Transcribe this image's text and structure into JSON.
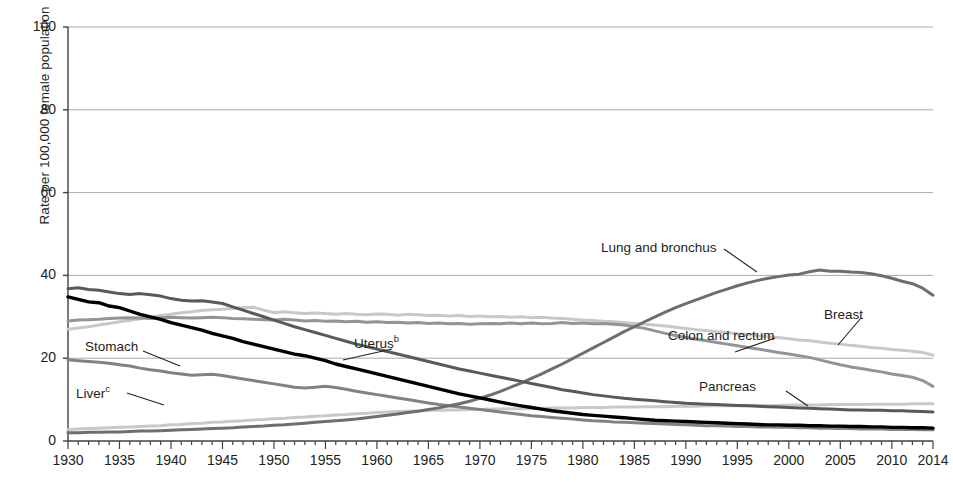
{
  "axes": {
    "ylabel": "Rate per 100,000 female population",
    "yticks": [
      "0",
      "20",
      "40",
      "60",
      "80",
      "100"
    ],
    "xticks": [
      "1930",
      "1935",
      "1940",
      "1945",
      "1950",
      "1955",
      "1960",
      "1965",
      "1970",
      "1975",
      "1980",
      "1985",
      "1990",
      "1995",
      "2000",
      "2005",
      "2010",
      "2014"
    ]
  },
  "labels": {
    "lung": "Lung and bronchus",
    "breast": "Breast",
    "colon": "Colon and rectum",
    "uterus": "Uterus",
    "uterus_sup": "b",
    "stomach": "Stomach",
    "liver": "Liver",
    "liver_sup": "c",
    "pancreas": "Pancreas"
  },
  "chart_data": {
    "type": "line",
    "title": "",
    "xlabel": "",
    "ylabel": "Rate per 100,000 female population",
    "xlim": [
      1930,
      2014
    ],
    "ylim": [
      0,
      100
    ],
    "grid": true,
    "legend": "inline-annotations",
    "x": [
      1930,
      1931,
      1932,
      1933,
      1934,
      1935,
      1936,
      1937,
      1938,
      1939,
      1940,
      1941,
      1942,
      1943,
      1944,
      1945,
      1946,
      1947,
      1948,
      1949,
      1950,
      1951,
      1952,
      1953,
      1954,
      1955,
      1956,
      1957,
      1958,
      1959,
      1960,
      1961,
      1962,
      1963,
      1964,
      1965,
      1966,
      1967,
      1968,
      1969,
      1970,
      1971,
      1972,
      1973,
      1974,
      1975,
      1976,
      1977,
      1978,
      1979,
      1980,
      1981,
      1982,
      1983,
      1984,
      1985,
      1986,
      1987,
      1988,
      1989,
      1990,
      1991,
      1992,
      1993,
      1994,
      1995,
      1996,
      1997,
      1998,
      1999,
      2000,
      2001,
      2002,
      2003,
      2004,
      2005,
      2006,
      2007,
      2008,
      2009,
      2010,
      2011,
      2012,
      2013,
      2014
    ],
    "series": [
      {
        "name": "Lung and bronchus",
        "color": "#6d6e71",
        "width": 3.0,
        "values": [
          2.0,
          2.0,
          2.1,
          2.1,
          2.2,
          2.2,
          2.3,
          2.4,
          2.4,
          2.5,
          2.6,
          2.7,
          2.8,
          2.9,
          3.0,
          3.1,
          3.2,
          3.4,
          3.5,
          3.6,
          3.8,
          3.9,
          4.1,
          4.3,
          4.5,
          4.7,
          4.9,
          5.1,
          5.3,
          5.6,
          5.9,
          6.2,
          6.5,
          6.9,
          7.2,
          7.6,
          8.0,
          8.5,
          9.0,
          9.6,
          10.3,
          11.1,
          12.0,
          13.0,
          14.0,
          15.1,
          16.2,
          17.4,
          18.6,
          19.9,
          21.2,
          22.5,
          23.8,
          25.1,
          26.4,
          27.6,
          28.8,
          30.0,
          31.1,
          32.2,
          33.2,
          34.1,
          35.0,
          35.9,
          36.7,
          37.5,
          38.2,
          38.8,
          39.3,
          39.7,
          40.1,
          40.3,
          40.9,
          41.3,
          41.0,
          41.0,
          40.8,
          40.7,
          40.4,
          39.9,
          39.3,
          38.6,
          38.0,
          36.9,
          35.2
        ]
      },
      {
        "name": "Breast",
        "color": "#c7c8ca",
        "width": 3.0,
        "values": [
          27.0,
          27.3,
          27.6,
          28.0,
          28.4,
          28.8,
          29.1,
          29.5,
          29.9,
          30.3,
          30.6,
          31.0,
          31.2,
          31.5,
          31.7,
          31.8,
          32.0,
          32.2,
          32.3,
          31.6,
          31.0,
          31.2,
          31.0,
          30.8,
          30.9,
          30.8,
          30.6,
          30.8,
          30.6,
          30.5,
          30.7,
          30.6,
          30.4,
          30.6,
          30.5,
          30.3,
          30.4,
          30.2,
          30.3,
          30.1,
          30.2,
          30.0,
          30.1,
          29.9,
          30.0,
          29.8,
          29.9,
          29.7,
          29.6,
          29.4,
          29.2,
          29.1,
          28.9,
          28.8,
          28.6,
          28.4,
          28.2,
          28.0,
          27.8,
          27.5,
          27.2,
          26.9,
          26.7,
          26.4,
          26.2,
          25.9,
          25.7,
          25.4,
          25.2,
          25.0,
          24.7,
          24.4,
          24.2,
          23.9,
          23.6,
          23.4,
          23.1,
          22.9,
          22.6,
          22.4,
          22.1,
          21.9,
          21.7,
          21.4,
          20.7
        ]
      },
      {
        "name": "Colon and rectum",
        "color": "#929497",
        "width": 3.0,
        "values": [
          29.0,
          29.2,
          29.3,
          29.4,
          29.6,
          29.7,
          29.8,
          29.7,
          29.6,
          29.8,
          29.9,
          29.8,
          29.7,
          29.8,
          29.9,
          29.8,
          29.6,
          29.5,
          29.4,
          29.3,
          29.2,
          29.4,
          29.2,
          29.0,
          29.1,
          28.9,
          29.0,
          28.8,
          28.9,
          28.7,
          28.8,
          28.6,
          28.7,
          28.5,
          28.6,
          28.4,
          28.5,
          28.3,
          28.4,
          28.2,
          28.3,
          28.4,
          28.3,
          28.5,
          28.3,
          28.5,
          28.3,
          28.4,
          28.6,
          28.4,
          28.5,
          28.3,
          28.4,
          28.2,
          28.0,
          27.6,
          27.2,
          26.6,
          26.0,
          25.5,
          25.0,
          24.6,
          24.2,
          23.8,
          23.4,
          23.0,
          22.6,
          22.2,
          21.8,
          21.4,
          21.0,
          20.6,
          20.2,
          19.6,
          19.0,
          18.4,
          17.9,
          17.5,
          17.1,
          16.7,
          16.2,
          15.8,
          15.4,
          14.6,
          13.2
        ]
      },
      {
        "name": "Uterus",
        "color": "#58595b",
        "width": 3.0,
        "values": [
          36.8,
          37.0,
          36.6,
          36.4,
          36.0,
          35.6,
          35.4,
          35.6,
          35.3,
          35.0,
          34.4,
          34.0,
          33.8,
          33.9,
          33.6,
          33.2,
          32.4,
          31.6,
          30.8,
          30.0,
          29.2,
          28.4,
          27.6,
          26.9,
          26.2,
          25.5,
          24.8,
          24.1,
          23.4,
          22.8,
          22.2,
          21.6,
          21.0,
          20.4,
          19.8,
          19.2,
          18.6,
          18.0,
          17.4,
          16.9,
          16.4,
          15.9,
          15.4,
          14.9,
          14.4,
          13.9,
          13.4,
          12.9,
          12.4,
          12.0,
          11.6,
          11.2,
          10.9,
          10.6,
          10.3,
          10.1,
          9.9,
          9.7,
          9.5,
          9.3,
          9.1,
          9.0,
          8.9,
          8.8,
          8.7,
          8.6,
          8.5,
          8.4,
          8.3,
          8.2,
          8.1,
          8.0,
          7.9,
          7.8,
          7.7,
          7.6,
          7.5,
          7.5,
          7.4,
          7.4,
          7.3,
          7.3,
          7.2,
          7.1,
          7.0
        ]
      },
      {
        "name": "Stomach",
        "color": "#000000",
        "width": 3.4,
        "values": [
          34.8,
          34.2,
          33.6,
          33.4,
          32.6,
          32.2,
          31.4,
          30.6,
          30.0,
          29.4,
          28.6,
          28.0,
          27.4,
          26.8,
          26.0,
          25.4,
          24.8,
          24.0,
          23.4,
          22.8,
          22.2,
          21.6,
          21.0,
          20.6,
          20.0,
          19.4,
          18.6,
          18.0,
          17.4,
          16.8,
          16.2,
          15.6,
          15.0,
          14.4,
          13.8,
          13.2,
          12.6,
          12.0,
          11.4,
          10.9,
          10.4,
          9.9,
          9.4,
          8.9,
          8.5,
          8.1,
          7.7,
          7.3,
          7.0,
          6.7,
          6.4,
          6.2,
          6.0,
          5.8,
          5.6,
          5.4,
          5.2,
          5.0,
          4.9,
          4.8,
          4.7,
          4.6,
          4.5,
          4.4,
          4.3,
          4.2,
          4.1,
          4.0,
          3.9,
          3.9,
          3.8,
          3.8,
          3.7,
          3.7,
          3.6,
          3.6,
          3.5,
          3.5,
          3.4,
          3.4,
          3.3,
          3.3,
          3.2,
          3.2,
          3.1
        ]
      },
      {
        "name": "Liver",
        "color": "#808285",
        "width": 3.0,
        "values": [
          19.6,
          19.4,
          19.2,
          19.0,
          18.8,
          18.4,
          18.1,
          17.6,
          17.2,
          16.9,
          16.5,
          16.2,
          15.9,
          16.0,
          16.1,
          15.8,
          15.4,
          15.0,
          14.6,
          14.2,
          13.8,
          13.4,
          13.0,
          12.8,
          13.0,
          13.2,
          12.9,
          12.5,
          12.0,
          11.6,
          11.2,
          10.8,
          10.4,
          10.0,
          9.6,
          9.2,
          8.8,
          8.5,
          8.2,
          7.9,
          7.6,
          7.3,
          7.0,
          6.7,
          6.4,
          6.1,
          5.9,
          5.7,
          5.5,
          5.3,
          5.1,
          4.9,
          4.8,
          4.6,
          4.5,
          4.4,
          4.3,
          4.2,
          4.1,
          4.0,
          3.9,
          3.8,
          3.7,
          3.7,
          3.6,
          3.5,
          3.5,
          3.4,
          3.4,
          3.3,
          3.3,
          3.2,
          3.2,
          3.1,
          3.1,
          3.0,
          3.0,
          2.9,
          2.9,
          2.9,
          2.8,
          2.8,
          2.8,
          2.7,
          2.7
        ]
      },
      {
        "name": "Pancreas",
        "color": "#c7c8ca",
        "width": 3.0,
        "values": [
          2.8,
          2.9,
          3.0,
          3.1,
          3.2,
          3.3,
          3.4,
          3.5,
          3.6,
          3.7,
          3.9,
          4.0,
          4.2,
          4.3,
          4.5,
          4.6,
          4.8,
          4.9,
          5.1,
          5.2,
          5.4,
          5.5,
          5.7,
          5.8,
          6.0,
          6.1,
          6.3,
          6.4,
          6.6,
          6.7,
          6.9,
          7.0,
          7.1,
          7.2,
          7.3,
          7.4,
          7.4,
          7.5,
          7.5,
          7.6,
          7.6,
          7.7,
          7.7,
          7.8,
          7.8,
          7.9,
          7.9,
          8.0,
          8.0,
          8.0,
          8.1,
          8.1,
          8.1,
          8.2,
          8.2,
          8.2,
          8.3,
          8.3,
          8.3,
          8.4,
          8.4,
          8.4,
          8.5,
          8.5,
          8.5,
          8.5,
          8.6,
          8.6,
          8.6,
          8.6,
          8.7,
          8.7,
          8.7,
          8.7,
          8.8,
          8.8,
          8.8,
          8.8,
          8.9,
          8.9,
          8.9,
          8.9,
          9.0,
          9.0,
          9.0
        ]
      }
    ]
  }
}
